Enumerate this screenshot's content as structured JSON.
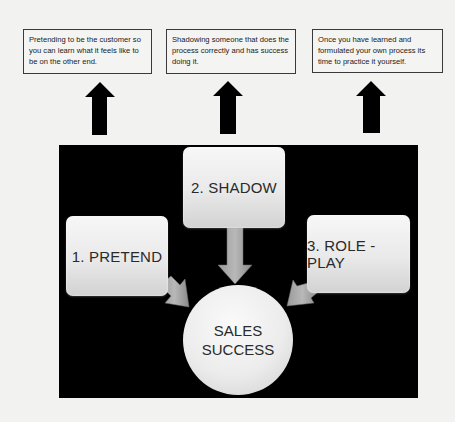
{
  "notes": [
    {
      "text": "Pretending to be the customer so you can learn what it feels like to be on the other end."
    },
    {
      "text": "Shadowing someone that does the process correctly and has success doing it."
    },
    {
      "text": "Once you have learned and formulated your own process its time to practice it yourself."
    }
  ],
  "steps": [
    {
      "label": "1. PRETEND"
    },
    {
      "label": "2. SHADOW"
    },
    {
      "label": "3. ROLE -PLAY"
    }
  ],
  "hub": {
    "line1": "SALES",
    "line2": "SUCCESS"
  },
  "colors": {
    "page_bg": "#f2f2f0",
    "panel_bg": "#000000",
    "arrow_dark": "#000000",
    "arrow_grey": "#8c8c8c",
    "box_light": "#ececec"
  }
}
